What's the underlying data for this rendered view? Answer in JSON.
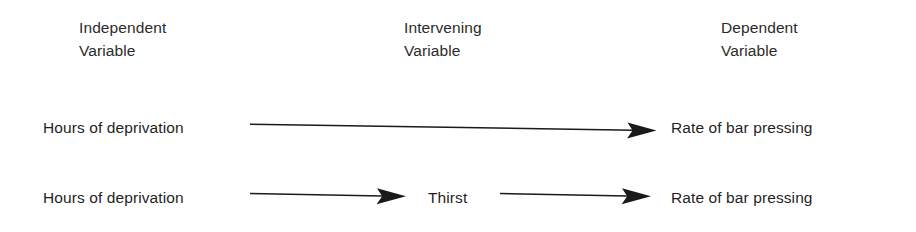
{
  "figure": {
    "background_color": "#ffffff",
    "ink_color": "#1a1a1a"
  },
  "headers": [
    {
      "id": "independent",
      "line1": "Independent",
      "line2": "Variable"
    },
    {
      "id": "intervening",
      "line1": "Intervening",
      "line2": "Variable"
    },
    {
      "id": "dependent",
      "line1": "Dependent",
      "line2": "Variable"
    }
  ],
  "rows": [
    {
      "id": "row-1",
      "independent": "Hours of deprivation",
      "intervening": "",
      "dependent": "Rate of bar pressing",
      "arrows": 1
    },
    {
      "id": "row-2",
      "independent": "Hours of deprivation",
      "intervening": "Thirst",
      "dependent": "Rate of bar pressing",
      "arrows": 2
    }
  ],
  "arrows": [
    {
      "id": "arrow-row1-ind-to-dep",
      "from": "Hours of deprivation",
      "to": "Rate of bar pressing"
    },
    {
      "id": "arrow-row2-ind-to-int",
      "from": "Hours of deprivation",
      "to": "Thirst"
    },
    {
      "id": "arrow-row2-int-to-dep",
      "from": "Thirst",
      "to": "Rate of bar pressing"
    }
  ]
}
